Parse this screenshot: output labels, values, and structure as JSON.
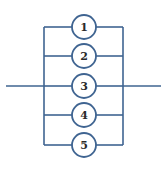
{
  "diagram": {
    "type": "parallel-network",
    "colors": {
      "line": "#3f6491",
      "label": "#2a2a2a",
      "node_fill": "#ffffff"
    },
    "input_terminal": {
      "x1": 6,
      "x2": 44,
      "y": 86
    },
    "output_terminal": {
      "x1": 123,
      "x2": 161,
      "y": 86
    },
    "left_bus": {
      "x": 44,
      "y1": 27,
      "y2": 145
    },
    "right_bus": {
      "x": 123,
      "y1": 27,
      "y2": 145
    },
    "node_radius": 12,
    "components": [
      {
        "label": "1",
        "cx": 84,
        "cy": 27
      },
      {
        "label": "2",
        "cx": 84,
        "cy": 56
      },
      {
        "label": "3",
        "cx": 84,
        "cy": 86
      },
      {
        "label": "4",
        "cx": 84,
        "cy": 115
      },
      {
        "label": "5",
        "cx": 84,
        "cy": 145
      }
    ]
  }
}
